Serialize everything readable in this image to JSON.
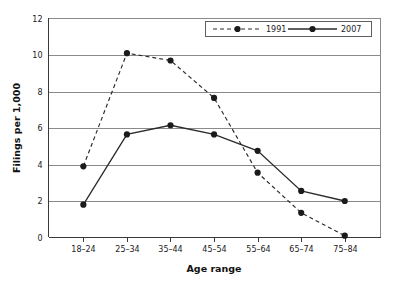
{
  "chart_data": {
    "type": "line",
    "title": "",
    "xlabel": "Age range",
    "ylabel": "Filings per 1,000",
    "categories": [
      "18–24",
      "25–34",
      "35–44",
      "45–54",
      "55–64",
      "65–74",
      "75–84"
    ],
    "ylim": [
      0,
      12
    ],
    "yticks": [
      0,
      2,
      4,
      6,
      8,
      10,
      12
    ],
    "ytick_labels": [
      "0",
      "2",
      "4",
      "6",
      "8",
      "10",
      "12"
    ],
    "grid": "horizontal",
    "legend_position": "top-right",
    "series": [
      {
        "name": "1991",
        "style": "dashed",
        "marker": "circle",
        "color": "#2b2b2b",
        "values": [
          3.9,
          10.1,
          9.7,
          7.65,
          3.55,
          1.35,
          0.1
        ]
      },
      {
        "name": "2007",
        "style": "solid",
        "marker": "circle",
        "color": "#2b2b2b",
        "values": [
          1.8,
          5.65,
          6.15,
          5.65,
          4.75,
          2.55,
          2.0
        ]
      }
    ]
  },
  "axes": {
    "x_title": "Age range",
    "y_title": "Filings per 1,000"
  },
  "legend": {
    "entries": [
      {
        "label": "1991",
        "style": "dashed"
      },
      {
        "label": "2007",
        "style": "solid"
      }
    ]
  },
  "colors": {
    "series": "#2b2b2b",
    "gridline": "#8a8a8a",
    "axis": "#3a3a3a",
    "background": "#ffffff"
  }
}
